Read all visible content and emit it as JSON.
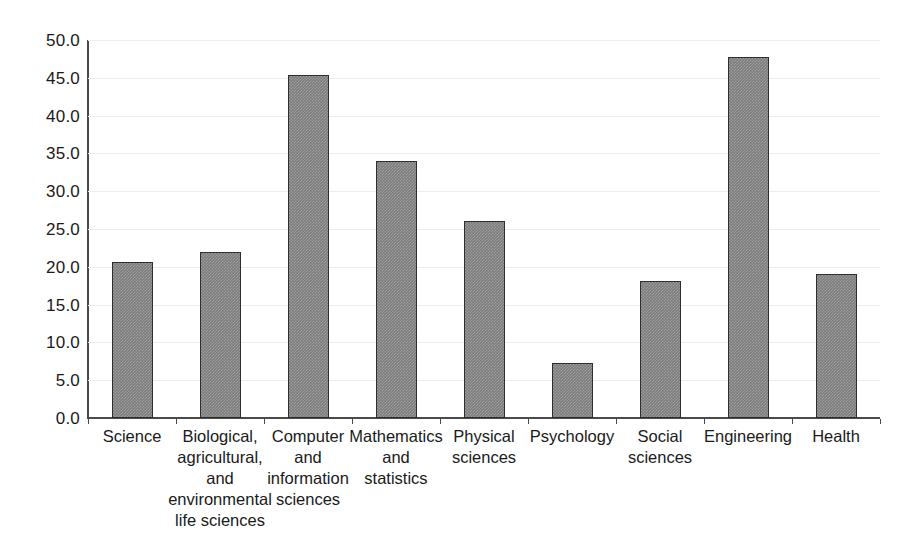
{
  "chart_data": {
    "type": "bar",
    "title": "",
    "subtitle": "",
    "xlabel": "",
    "ylabel": "",
    "ylim": [
      0.0,
      50.0
    ],
    "ytick_step": 5.0,
    "grid": "horizontal",
    "legend": "none",
    "bar_color": "#7d7d7d",
    "bar_edge_color": "#2e2e2e",
    "gridline_color": "#ededed",
    "axis_color": "#4a4a4a",
    "categories": [
      "Science",
      "Biological, agricultural, and environmental life sciences",
      "Computer and information sciences",
      "Mathematics and statistics",
      "Physical sciences",
      "Psychology",
      "Social sciences",
      "Engineering",
      "Health"
    ],
    "category_lines": [
      [
        "Science"
      ],
      [
        "Biological,",
        "agricultural,",
        "and",
        "environmental",
        "life sciences"
      ],
      [
        "Computer",
        "and",
        "information",
        "sciences"
      ],
      [
        "Mathematics",
        "and",
        "statistics"
      ],
      [
        "Physical",
        "sciences"
      ],
      [
        "Psychology"
      ],
      [
        "Social",
        "sciences"
      ],
      [
        "Engineering"
      ],
      [
        "Health"
      ]
    ],
    "values": [
      20.6,
      22.0,
      45.4,
      34.0,
      26.0,
      7.3,
      18.1,
      47.7,
      19.1
    ],
    "ytick_labels": [
      "50.0",
      "45.0",
      "40.0",
      "35.0",
      "30.0",
      "25.0",
      "20.0",
      "15.0",
      "10.0",
      "5.0",
      "0.0"
    ],
    "ytick_values": [
      50.0,
      45.0,
      40.0,
      35.0,
      30.0,
      25.0,
      20.0,
      15.0,
      10.0,
      5.0,
      0.0
    ]
  }
}
